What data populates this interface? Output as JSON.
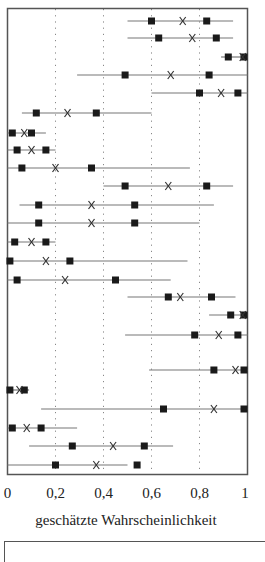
{
  "chart_data": {
    "type": "scatter",
    "title": "",
    "xlabel": "geschätzte Wahrscheinlichkeit",
    "ylabel": "",
    "xlim": [
      0,
      1
    ],
    "x_ticks": [
      0,
      0.2,
      0.4,
      0.6,
      0.8,
      1
    ],
    "x_tick_labels": [
      "0",
      "0,2",
      "0,4",
      "0,6",
      "0,8",
      "1"
    ],
    "grid": {
      "vertical_dotted_at": [
        0.2,
        0.4,
        0.6,
        0.8
      ]
    },
    "legend": null,
    "markers": {
      "range_line": "line from low to high",
      "square": "interval bounds",
      "x": "point estimate"
    },
    "rows": [
      {
        "line": [
          0.5,
          0.94
        ],
        "sq_low": 0.6,
        "x": 0.73,
        "sq_high": 0.83
      },
      {
        "line": [
          0.5,
          0.94
        ],
        "sq_low": 0.63,
        "x": 0.77,
        "sq_high": 0.87
      },
      {
        "line": [
          0.89,
          1.0
        ],
        "sq_low": 0.92,
        "x": 0.98,
        "sq_high": 1.0
      },
      {
        "line": [
          0.29,
          1.0
        ],
        "sq_low": 0.49,
        "x": 0.68,
        "sq_high": 0.84
      },
      {
        "line": [
          0.6,
          1.0
        ],
        "sq_low": 0.8,
        "x": 0.89,
        "sq_high": 0.96
      },
      {
        "line": [
          0.06,
          0.6
        ],
        "sq_low": 0.12,
        "x": 0.25,
        "sq_high": 0.37
      },
      {
        "line": [
          0.0,
          0.16
        ],
        "sq_low": 0.02,
        "x": 0.07,
        "sq_high": 0.1
      },
      {
        "line": [
          0.0,
          0.2
        ],
        "sq_low": 0.04,
        "x": 0.1,
        "sq_high": 0.16
      },
      {
        "line": [
          0.0,
          0.76
        ],
        "sq_low": 0.06,
        "x": 0.2,
        "sq_high": 0.35
      },
      {
        "line": [
          0.4,
          0.94
        ],
        "sq_low": 0.49,
        "x": 0.67,
        "sq_high": 0.83
      },
      {
        "line": [
          0.05,
          0.86
        ],
        "sq_low": 0.13,
        "x": 0.35,
        "sq_high": 0.53
      },
      {
        "line": [
          0.0,
          0.8
        ],
        "sq_low": 0.13,
        "x": 0.35,
        "sq_high": 0.53
      },
      {
        "line": [
          0.0,
          0.2
        ],
        "sq_low": 0.03,
        "x": 0.1,
        "sq_high": 0.16
      },
      {
        "line": [
          0.0,
          0.75
        ],
        "sq_low": 0.01,
        "x": 0.16,
        "sq_high": 0.26
      },
      {
        "line": [
          0.0,
          0.68
        ],
        "sq_low": 0.04,
        "x": 0.24,
        "sq_high": 0.45
      },
      {
        "line": [
          0.5,
          0.95
        ],
        "sq_low": 0.67,
        "x": 0.72,
        "sq_high": 0.85
      },
      {
        "line": [
          0.84,
          1.0
        ],
        "sq_low": 0.93,
        "x": 0.98,
        "sq_high": 1.0
      },
      {
        "line": [
          0.49,
          1.0
        ],
        "sq_low": 0.78,
        "x": 0.88,
        "sq_high": 0.96
      },
      {
        "line": [
          0.59,
          1.0
        ],
        "sq_low": 0.86,
        "x": 0.95,
        "sq_high": 0.995
      },
      {
        "line": [
          0.0,
          0.09
        ],
        "sq_low": 0.01,
        "x": 0.05,
        "sq_high": 0.07
      },
      {
        "line": [
          0.14,
          1.0
        ],
        "sq_low": 0.65,
        "x": 0.86,
        "sq_high": 1.0
      },
      {
        "line": [
          0.0,
          0.29
        ],
        "sq_low": 0.02,
        "x": 0.08,
        "sq_high": 0.14
      },
      {
        "line": [
          0.09,
          0.69
        ],
        "sq_low": 0.27,
        "x": 0.44,
        "sq_high": 0.57
      },
      {
        "line": [
          0.0,
          0.5
        ],
        "sq_low": 0.2,
        "x": 0.37,
        "sq_high": 0.54
      }
    ],
    "row_y_px": [
      21,
      38,
      57,
      75,
      93,
      113,
      133,
      150,
      168,
      186,
      205,
      223,
      242,
      261,
      280,
      297,
      315,
      335,
      370,
      390,
      409,
      428,
      446,
      465
    ],
    "colors": {
      "frame": "#555555",
      "line": "#777777",
      "marker": "#1a1a1a",
      "grid": "#888888"
    }
  }
}
